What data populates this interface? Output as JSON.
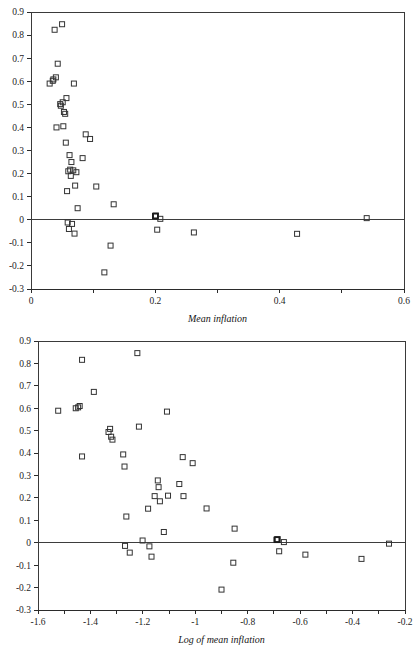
{
  "page": {
    "background_color": "#ffffff",
    "marker_color": "#333333",
    "axis_color": "#2b2b2b"
  },
  "charts": [
    {
      "id": "chart-mean-inflation",
      "title": "",
      "xlabel": "Mean inflation",
      "ylabel": "",
      "type": "scatter",
      "xlim": [
        0,
        0.6
      ],
      "ylim": [
        -0.3,
        0.9
      ],
      "xticks": [
        0,
        0.1,
        0.2,
        0.3,
        0.4,
        0.5,
        0.6
      ],
      "xticklabels": [
        "0",
        "",
        "0.2",
        "",
        "0.4",
        "",
        "0.6"
      ],
      "yticks": [
        -0.3,
        -0.2,
        -0.1,
        0,
        0.1,
        0.2,
        0.3,
        0.4,
        0.5,
        0.6,
        0.7,
        0.8,
        0.9
      ],
      "yticklabels": [
        "-0.3",
        "-0.2",
        "-0.1",
        "0",
        "0.1",
        "0.2",
        "0.3",
        "0.4",
        "0.5",
        "0.6",
        "0.7",
        "0.8",
        "0.9"
      ],
      "grid": false,
      "legend": null,
      "zero_line": true,
      "points": [
        {
          "x": 0.03,
          "y": 0.59
        },
        {
          "x": 0.035,
          "y": 0.602
        },
        {
          "x": 0.036,
          "y": 0.608
        },
        {
          "x": 0.038,
          "y": 0.823
        },
        {
          "x": 0.04,
          "y": 0.617
        },
        {
          "x": 0.041,
          "y": 0.4
        },
        {
          "x": 0.043,
          "y": 0.676
        },
        {
          "x": 0.047,
          "y": 0.501
        },
        {
          "x": 0.048,
          "y": 0.494
        },
        {
          "x": 0.05,
          "y": 0.847
        },
        {
          "x": 0.051,
          "y": 0.509
        },
        {
          "x": 0.052,
          "y": 0.405
        },
        {
          "x": 0.053,
          "y": 0.467
        },
        {
          "x": 0.055,
          "y": 0.459
        },
        {
          "x": 0.056,
          "y": 0.334
        },
        {
          "x": 0.057,
          "y": 0.527
        },
        {
          "x": 0.058,
          "y": 0.124
        },
        {
          "x": 0.059,
          "y": -0.012
        },
        {
          "x": 0.06,
          "y": 0.21
        },
        {
          "x": 0.061,
          "y": -0.04
        },
        {
          "x": 0.062,
          "y": 0.28
        },
        {
          "x": 0.063,
          "y": 0.217
        },
        {
          "x": 0.064,
          "y": 0.19
        },
        {
          "x": 0.065,
          "y": 0.25
        },
        {
          "x": 0.066,
          "y": -0.018
        },
        {
          "x": 0.068,
          "y": 0.214
        },
        {
          "x": 0.069,
          "y": 0.59
        },
        {
          "x": 0.07,
          "y": -0.06
        },
        {
          "x": 0.071,
          "y": 0.148
        },
        {
          "x": 0.073,
          "y": 0.206
        },
        {
          "x": 0.075,
          "y": 0.05
        },
        {
          "x": 0.083,
          "y": 0.267
        },
        {
          "x": 0.088,
          "y": 0.37
        },
        {
          "x": 0.095,
          "y": 0.35
        },
        {
          "x": 0.105,
          "y": 0.144
        },
        {
          "x": 0.118,
          "y": -0.228
        },
        {
          "x": 0.128,
          "y": -0.112
        },
        {
          "x": 0.133,
          "y": 0.067
        },
        {
          "x": 0.2,
          "y": 0.015
        },
        {
          "x": 0.201,
          "y": 0.018
        },
        {
          "x": 0.203,
          "y": -0.043
        },
        {
          "x": 0.208,
          "y": 0.004
        },
        {
          "x": 0.262,
          "y": -0.055
        },
        {
          "x": 0.428,
          "y": -0.061
        },
        {
          "x": 0.54,
          "y": 0.007
        }
      ],
      "bold_points": [
        {
          "x": 0.2,
          "y": 0.016
        }
      ]
    },
    {
      "id": "chart-log-mean-inflation",
      "title": "",
      "xlabel": "Log of mean inflation",
      "ylabel": "",
      "type": "scatter",
      "xlim": [
        -1.6,
        -0.2
      ],
      "ylim": [
        -0.3,
        0.9
      ],
      "xticks": [
        -1.6,
        -1.5,
        -1.4,
        -1.3,
        -1.2,
        -1.1,
        -1.0,
        -0.9,
        -0.8,
        -0.7,
        -0.6,
        -0.5,
        -0.4,
        -0.3,
        -0.2
      ],
      "xticklabels": [
        "-1.6",
        "",
        "-1.4",
        "",
        "-1.2",
        "",
        "-1",
        "",
        "-0.8",
        "",
        "-0.6",
        "",
        "-0.4",
        "",
        "-0.2"
      ],
      "yticks": [
        -0.3,
        -0.2,
        -0.1,
        0,
        0.1,
        0.2,
        0.3,
        0.4,
        0.5,
        0.6,
        0.7,
        0.8,
        0.9
      ],
      "yticklabels": [
        "-0.3",
        "-0.2",
        "-0.1",
        "0",
        "0.1",
        "0.2",
        "0.3",
        "0.4",
        "0.5",
        "0.6",
        "0.7",
        "0.8",
        "0.9"
      ],
      "grid": false,
      "legend": null,
      "zero_line": true,
      "points": [
        {
          "x": -1.523,
          "y": 0.589
        },
        {
          "x": -1.456,
          "y": 0.6
        },
        {
          "x": -1.447,
          "y": 0.604
        },
        {
          "x": -1.432,
          "y": 0.816
        },
        {
          "x": -1.441,
          "y": 0.61
        },
        {
          "x": -1.432,
          "y": 0.385
        },
        {
          "x": -1.387,
          "y": 0.673
        },
        {
          "x": -1.331,
          "y": 0.494
        },
        {
          "x": -1.325,
          "y": 0.508
        },
        {
          "x": -1.321,
          "y": 0.473
        },
        {
          "x": -1.316,
          "y": 0.46
        },
        {
          "x": -1.275,
          "y": 0.394
        },
        {
          "x": -1.27,
          "y": 0.34
        },
        {
          "x": -1.263,
          "y": 0.117
        },
        {
          "x": -1.268,
          "y": -0.014
        },
        {
          "x": -1.25,
          "y": -0.044
        },
        {
          "x": -1.221,
          "y": 0.846
        },
        {
          "x": -1.215,
          "y": 0.518
        },
        {
          "x": -1.201,
          "y": 0.01
        },
        {
          "x": -1.18,
          "y": 0.152
        },
        {
          "x": -1.175,
          "y": -0.016
        },
        {
          "x": -1.167,
          "y": -0.062
        },
        {
          "x": -1.155,
          "y": 0.208
        },
        {
          "x": -1.143,
          "y": 0.278
        },
        {
          "x": -1.14,
          "y": 0.248
        },
        {
          "x": -1.135,
          "y": 0.185
        },
        {
          "x": -1.12,
          "y": 0.048
        },
        {
          "x": -1.108,
          "y": 0.585
        },
        {
          "x": -1.104,
          "y": 0.21
        },
        {
          "x": -1.061,
          "y": 0.262
        },
        {
          "x": -1.048,
          "y": 0.382
        },
        {
          "x": -1.045,
          "y": 0.208
        },
        {
          "x": -1.01,
          "y": 0.355
        },
        {
          "x": -0.957,
          "y": 0.153
        },
        {
          "x": -0.9,
          "y": -0.209
        },
        {
          "x": -0.855,
          "y": -0.089
        },
        {
          "x": -0.85,
          "y": 0.063
        },
        {
          "x": -0.69,
          "y": 0.012
        },
        {
          "x": -0.686,
          "y": 0.016
        },
        {
          "x": -0.68,
          "y": -0.038
        },
        {
          "x": -0.662,
          "y": 0.003
        },
        {
          "x": -0.58,
          "y": -0.053
        },
        {
          "x": -0.366,
          "y": -0.072
        },
        {
          "x": -0.261,
          "y": -0.004
        }
      ],
      "bold_points": [
        {
          "x": -0.688,
          "y": 0.014
        }
      ]
    }
  ]
}
